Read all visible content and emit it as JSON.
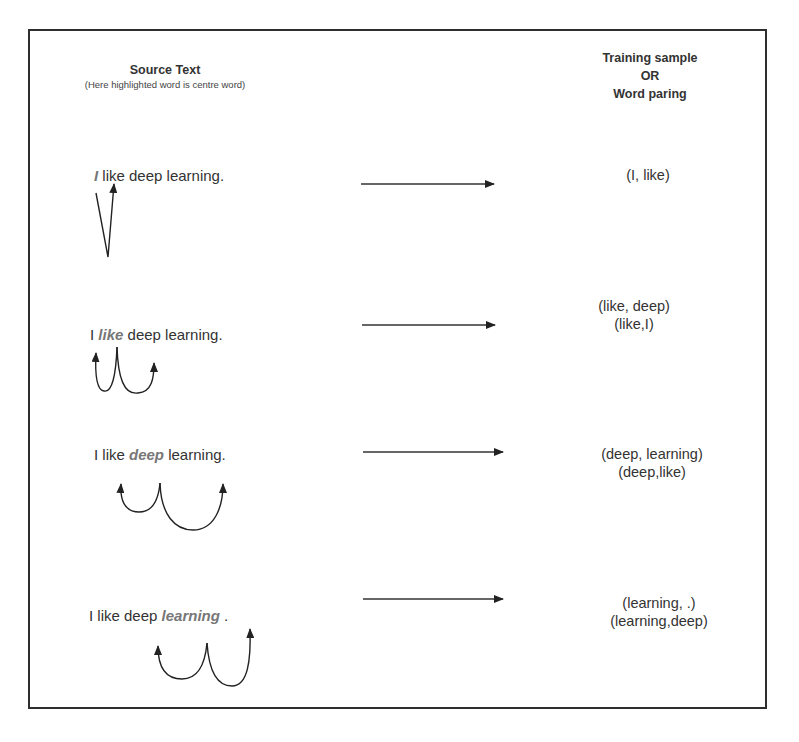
{
  "header": {
    "source_title": "Source Text",
    "source_subtitle": "(Here highlighted word is centre word)",
    "target_title_line1": "Training sample",
    "target_title_line2": "OR",
    "target_title_line3": "Word paring"
  },
  "rows": [
    {
      "before": "",
      "center": "I",
      "after": " like deep learning.",
      "pairs": [
        "(I, like)"
      ]
    },
    {
      "before": "I ",
      "center": "like",
      "after": " deep learning.",
      "pairs": [
        "(like, deep)",
        "(like,I)"
      ]
    },
    {
      "before": "I like ",
      "center": "deep",
      "after": " learning.",
      "pairs": [
        "(deep, learning)",
        "(deep,like)"
      ]
    },
    {
      "before": "I like deep ",
      "center": "learning",
      "after": " .",
      "pairs": [
        "(learning, .)",
        "(learning,deep)"
      ]
    }
  ],
  "colors": {
    "frame": "#2e2e2e",
    "text": "#333333",
    "highlight": "#777777",
    "arrow": "#222222"
  }
}
